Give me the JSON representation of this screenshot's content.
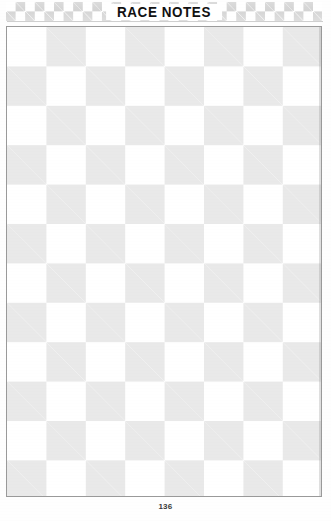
{
  "page": {
    "title": "RACE NOTES",
    "page_number": "136",
    "background_color": "#fefefe"
  },
  "header": {
    "title": "RACE NOTES",
    "pattern": "checkered-flag",
    "checker_light_color": "#ffffff",
    "checker_dark_color": "#d4d4d4",
    "checker_square_px": 10,
    "rows": 2
  },
  "notes_area": {
    "label": "race-notes-writing-area",
    "pattern": "checkerboard",
    "checker_light_color": "#ffffff",
    "checker_dark_color": "#e9e9e9",
    "checker_square_px": 39,
    "columns": 8,
    "rows": 12,
    "border_color": "#9a9a9a"
  },
  "footer": {
    "page_number": "136"
  }
}
